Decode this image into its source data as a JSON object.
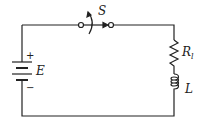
{
  "diagram": {
    "type": "circuit",
    "components": {
      "switch": {
        "label": "S"
      },
      "battery": {
        "label": "E",
        "plus": "+",
        "minus": "−"
      },
      "resistor": {
        "label": "R",
        "subscript": "l"
      },
      "inductor": {
        "label": "L"
      }
    },
    "colors": {
      "wire": "#222222",
      "background": "#ffffff"
    }
  }
}
